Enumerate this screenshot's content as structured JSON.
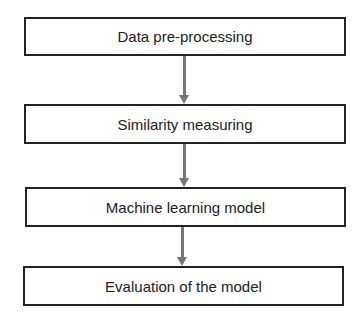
{
  "diagram": {
    "type": "flowchart",
    "direction": "top-to-bottom",
    "steps": [
      {
        "label": "Data pre-processing"
      },
      {
        "label": "Similarity measuring"
      },
      {
        "label": "Machine learning model"
      },
      {
        "label": "Evaluation of the model"
      }
    ],
    "edges": [
      {
        "from": 0,
        "to": 1
      },
      {
        "from": 1,
        "to": 2
      },
      {
        "from": 2,
        "to": 3
      }
    ],
    "colors": {
      "border": "#222222",
      "arrow": "#777777",
      "background": "#ffffff"
    }
  }
}
